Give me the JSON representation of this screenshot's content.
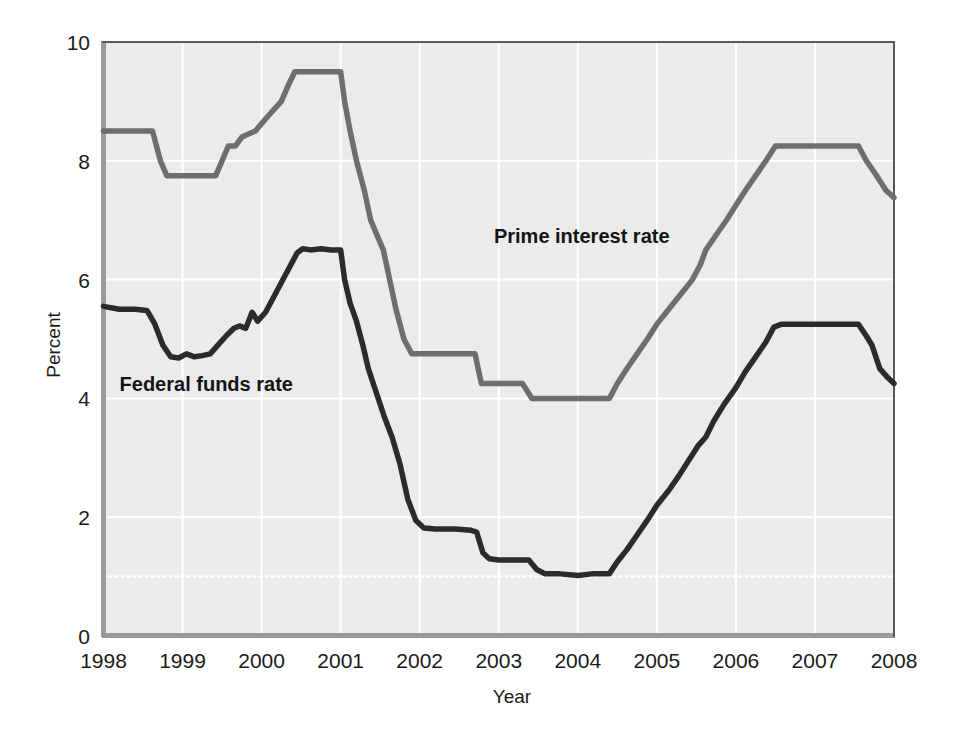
{
  "chart_data": {
    "type": "line",
    "title": "",
    "xlabel": "Year",
    "ylabel": "Percent",
    "xlim": [
      1998,
      2008
    ],
    "ylim": [
      0,
      10
    ],
    "xticks": [
      "1998",
      "1999",
      "2000",
      "2001",
      "2002",
      "2003",
      "2004",
      "2005",
      "2006",
      "2007",
      "2008"
    ],
    "yticks": [
      "0",
      "2",
      "4",
      "6",
      "8",
      "10"
    ],
    "grid": true,
    "legend_position": "inline-annotations",
    "plot_background": "#ebebeb",
    "series": [
      {
        "name": "Prime interest rate",
        "color": "#6e6e6e",
        "label_x": 2004.05,
        "label_y": 6.62,
        "points": [
          [
            1998.0,
            8.5
          ],
          [
            1998.5,
            8.5
          ],
          [
            1998.62,
            8.5
          ],
          [
            1998.72,
            8.0
          ],
          [
            1998.8,
            7.75
          ],
          [
            1999.0,
            7.75
          ],
          [
            1999.3,
            7.75
          ],
          [
            1999.42,
            7.75
          ],
          [
            1999.5,
            8.0
          ],
          [
            1999.58,
            8.25
          ],
          [
            1999.67,
            8.25
          ],
          [
            1999.75,
            8.4
          ],
          [
            1999.92,
            8.5
          ],
          [
            2000.08,
            8.75
          ],
          [
            2000.25,
            9.0
          ],
          [
            2000.33,
            9.25
          ],
          [
            2000.42,
            9.5
          ],
          [
            2000.5,
            9.5
          ],
          [
            2000.75,
            9.5
          ],
          [
            2000.92,
            9.5
          ],
          [
            2001.0,
            9.5
          ],
          [
            2001.05,
            9.0
          ],
          [
            2001.12,
            8.5
          ],
          [
            2001.2,
            8.0
          ],
          [
            2001.3,
            7.5
          ],
          [
            2001.38,
            7.0
          ],
          [
            2001.46,
            6.75
          ],
          [
            2001.54,
            6.5
          ],
          [
            2001.62,
            6.0
          ],
          [
            2001.7,
            5.5
          ],
          [
            2001.8,
            5.0
          ],
          [
            2001.9,
            4.75
          ],
          [
            2002.0,
            4.75
          ],
          [
            2002.5,
            4.75
          ],
          [
            2002.7,
            4.75
          ],
          [
            2002.78,
            4.25
          ],
          [
            2003.0,
            4.25
          ],
          [
            2003.3,
            4.25
          ],
          [
            2003.42,
            4.0
          ],
          [
            2003.6,
            4.0
          ],
          [
            2004.0,
            4.0
          ],
          [
            2004.4,
            4.0
          ],
          [
            2004.5,
            4.25
          ],
          [
            2004.62,
            4.5
          ],
          [
            2004.75,
            4.75
          ],
          [
            2004.88,
            5.0
          ],
          [
            2005.0,
            5.25
          ],
          [
            2005.15,
            5.5
          ],
          [
            2005.3,
            5.75
          ],
          [
            2005.45,
            6.0
          ],
          [
            2005.55,
            6.25
          ],
          [
            2005.62,
            6.5
          ],
          [
            2005.75,
            6.75
          ],
          [
            2005.88,
            7.0
          ],
          [
            2006.0,
            7.25
          ],
          [
            2006.12,
            7.5
          ],
          [
            2006.25,
            7.75
          ],
          [
            2006.38,
            8.0
          ],
          [
            2006.5,
            8.25
          ],
          [
            2006.58,
            8.25
          ],
          [
            2007.0,
            8.25
          ],
          [
            2007.4,
            8.25
          ],
          [
            2007.55,
            8.25
          ],
          [
            2007.65,
            8.0
          ],
          [
            2007.78,
            7.75
          ],
          [
            2007.9,
            7.5
          ],
          [
            2008.0,
            7.38
          ]
        ]
      },
      {
        "name": "Federal funds rate",
        "color": "#2b2b2b",
        "label_x": 1999.3,
        "label_y": 4.12,
        "points": [
          [
            1998.0,
            5.55
          ],
          [
            1998.2,
            5.5
          ],
          [
            1998.4,
            5.5
          ],
          [
            1998.55,
            5.48
          ],
          [
            1998.65,
            5.25
          ],
          [
            1998.75,
            4.9
          ],
          [
            1998.85,
            4.7
          ],
          [
            1998.95,
            4.68
          ],
          [
            1999.05,
            4.75
          ],
          [
            1999.15,
            4.7
          ],
          [
            1999.25,
            4.72
          ],
          [
            1999.35,
            4.75
          ],
          [
            1999.45,
            4.9
          ],
          [
            1999.55,
            5.05
          ],
          [
            1999.65,
            5.18
          ],
          [
            1999.72,
            5.22
          ],
          [
            1999.8,
            5.18
          ],
          [
            1999.88,
            5.45
          ],
          [
            1999.95,
            5.3
          ],
          [
            2000.05,
            5.45
          ],
          [
            2000.15,
            5.7
          ],
          [
            2000.25,
            5.95
          ],
          [
            2000.35,
            6.2
          ],
          [
            2000.45,
            6.45
          ],
          [
            2000.52,
            6.52
          ],
          [
            2000.62,
            6.5
          ],
          [
            2000.75,
            6.52
          ],
          [
            2000.88,
            6.5
          ],
          [
            2001.0,
            6.5
          ],
          [
            2001.05,
            6.0
          ],
          [
            2001.12,
            5.6
          ],
          [
            2001.2,
            5.3
          ],
          [
            2001.28,
            4.9
          ],
          [
            2001.35,
            4.5
          ],
          [
            2001.45,
            4.1
          ],
          [
            2001.55,
            3.7
          ],
          [
            2001.65,
            3.35
          ],
          [
            2001.75,
            2.9
          ],
          [
            2001.85,
            2.3
          ],
          [
            2001.95,
            1.95
          ],
          [
            2002.05,
            1.82
          ],
          [
            2002.2,
            1.8
          ],
          [
            2002.45,
            1.8
          ],
          [
            2002.65,
            1.78
          ],
          [
            2002.72,
            1.75
          ],
          [
            2002.8,
            1.4
          ],
          [
            2002.88,
            1.3
          ],
          [
            2003.0,
            1.28
          ],
          [
            2003.2,
            1.28
          ],
          [
            2003.38,
            1.28
          ],
          [
            2003.48,
            1.12
          ],
          [
            2003.58,
            1.05
          ],
          [
            2003.75,
            1.05
          ],
          [
            2004.0,
            1.02
          ],
          [
            2004.2,
            1.05
          ],
          [
            2004.4,
            1.05
          ],
          [
            2004.5,
            1.25
          ],
          [
            2004.62,
            1.45
          ],
          [
            2004.75,
            1.7
          ],
          [
            2004.88,
            1.95
          ],
          [
            2005.0,
            2.2
          ],
          [
            2005.15,
            2.45
          ],
          [
            2005.28,
            2.7
          ],
          [
            2005.4,
            2.95
          ],
          [
            2005.52,
            3.2
          ],
          [
            2005.62,
            3.35
          ],
          [
            2005.72,
            3.62
          ],
          [
            2005.85,
            3.9
          ],
          [
            2006.0,
            4.18
          ],
          [
            2006.12,
            4.45
          ],
          [
            2006.25,
            4.7
          ],
          [
            2006.38,
            4.95
          ],
          [
            2006.48,
            5.2
          ],
          [
            2006.58,
            5.25
          ],
          [
            2006.7,
            5.25
          ],
          [
            2007.0,
            5.25
          ],
          [
            2007.4,
            5.25
          ],
          [
            2007.55,
            5.25
          ],
          [
            2007.65,
            5.05
          ],
          [
            2007.72,
            4.9
          ],
          [
            2007.82,
            4.5
          ],
          [
            2007.92,
            4.35
          ],
          [
            2008.0,
            4.25
          ]
        ]
      }
    ],
    "extra_gridline": {
      "y": 1.0,
      "style": "dotted",
      "color": "#ffffff"
    }
  },
  "axes": {
    "y_label": "Percent",
    "x_label": "Year"
  }
}
